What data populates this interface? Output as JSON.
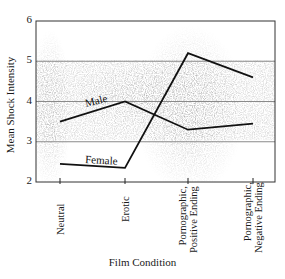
{
  "chart_data": {
    "type": "line",
    "title": "",
    "xlabel": "Film Condition",
    "ylabel": "Mean Shock Intensity",
    "categories": [
      "Neutral",
      "Erotic",
      "Pornographic, Positive Ending",
      "Pornographic, Negative Ending"
    ],
    "category_lines": [
      [
        "Neutral"
      ],
      [
        "Erotic"
      ],
      [
        "Pornographic,",
        "Positive Ending"
      ],
      [
        "Pornographic,",
        "Negative Ending"
      ]
    ],
    "series": [
      {
        "name": "Male",
        "values": [
          3.5,
          4.0,
          3.3,
          3.45
        ]
      },
      {
        "name": "Female",
        "values": [
          2.45,
          2.35,
          5.2,
          4.6
        ]
      }
    ],
    "ylim": [
      2,
      6
    ],
    "yticks": [
      "2",
      "3",
      "4",
      "5",
      "6"
    ],
    "grid": true,
    "legend_position": "inline labels on lines",
    "colors": {
      "line": "#1a1a1a",
      "grid": "#8a8a8a",
      "noise": "#9a9a9a"
    }
  }
}
